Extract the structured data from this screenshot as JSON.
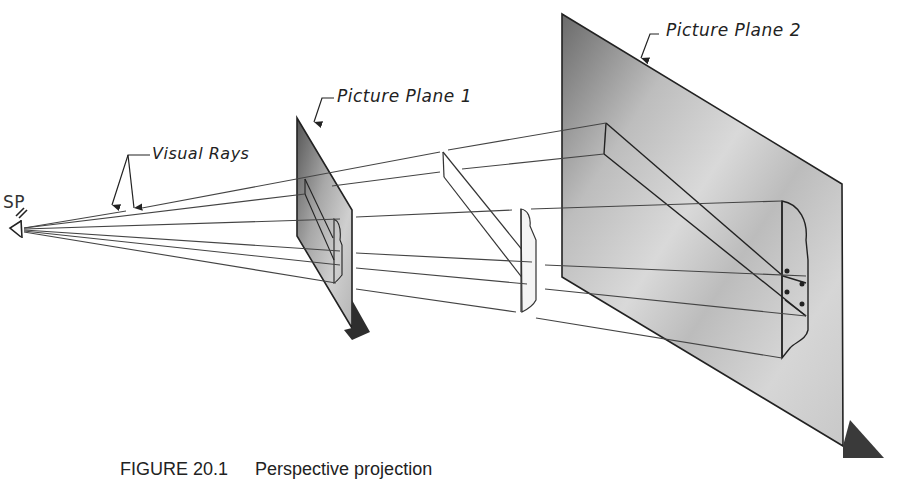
{
  "figure": {
    "caption_number": "FIGURE 20.1",
    "caption_title": "Perspective projection"
  },
  "labels": {
    "station_point": "SP",
    "visual_rays": "Visual Rays",
    "picture_plane_1": "Picture Plane  1",
    "picture_plane_2": "Picture Plane  2"
  },
  "colors": {
    "line": "#2a2a2a",
    "plane_dark": "#6e6e6e",
    "plane_light": "#d8d8d8",
    "background": "#ffffff"
  }
}
